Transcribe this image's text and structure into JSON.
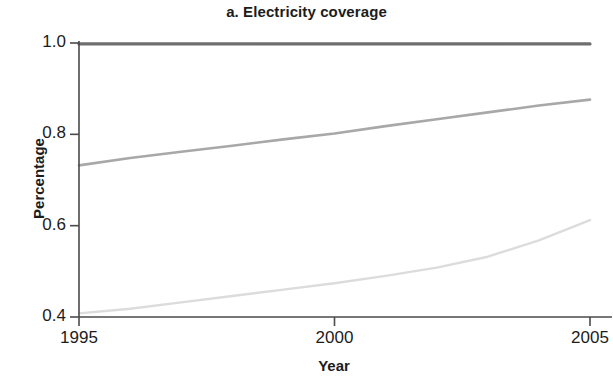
{
  "chart_data": {
    "type": "line",
    "title": "a. Electricity coverage",
    "xlabel": "Year",
    "ylabel": "Percentage",
    "xlim": [
      1995,
      2005
    ],
    "ylim": [
      0.4,
      1.0
    ],
    "xticks": [
      1995,
      2000,
      2005
    ],
    "xtick_labels": [
      "1995",
      "2000",
      "2005"
    ],
    "yticks": [
      0.4,
      0.6,
      0.8,
      1.0
    ],
    "ytick_labels": [
      "0.4",
      "0.6",
      "0.8",
      "1.0"
    ],
    "grid": false,
    "legend": "none",
    "x": [
      1995,
      1996,
      1997,
      1998,
      1999,
      2000,
      2001,
      2002,
      2003,
      2004,
      2005
    ],
    "series": [
      {
        "name": "top",
        "color": "#6e6e6e",
        "width": 3.2,
        "values": [
          0.998,
          0.998,
          0.998,
          0.998,
          0.998,
          0.998,
          0.998,
          0.998,
          0.998,
          0.998,
          0.998
        ]
      },
      {
        "name": "middle",
        "color": "#a8a8a8",
        "width": 2.6,
        "values": [
          0.732,
          0.748,
          0.762,
          0.775,
          0.789,
          0.802,
          0.818,
          0.833,
          0.848,
          0.863,
          0.876
        ]
      },
      {
        "name": "bottom",
        "color": "#dcdcdc",
        "width": 2.4,
        "values": [
          0.408,
          0.418,
          0.432,
          0.446,
          0.46,
          0.474,
          0.49,
          0.508,
          0.532,
          0.568,
          0.612
        ]
      }
    ]
  },
  "axes": {
    "axis_color": "#4a4a4a",
    "tick_color": "#4a4a4a"
  }
}
